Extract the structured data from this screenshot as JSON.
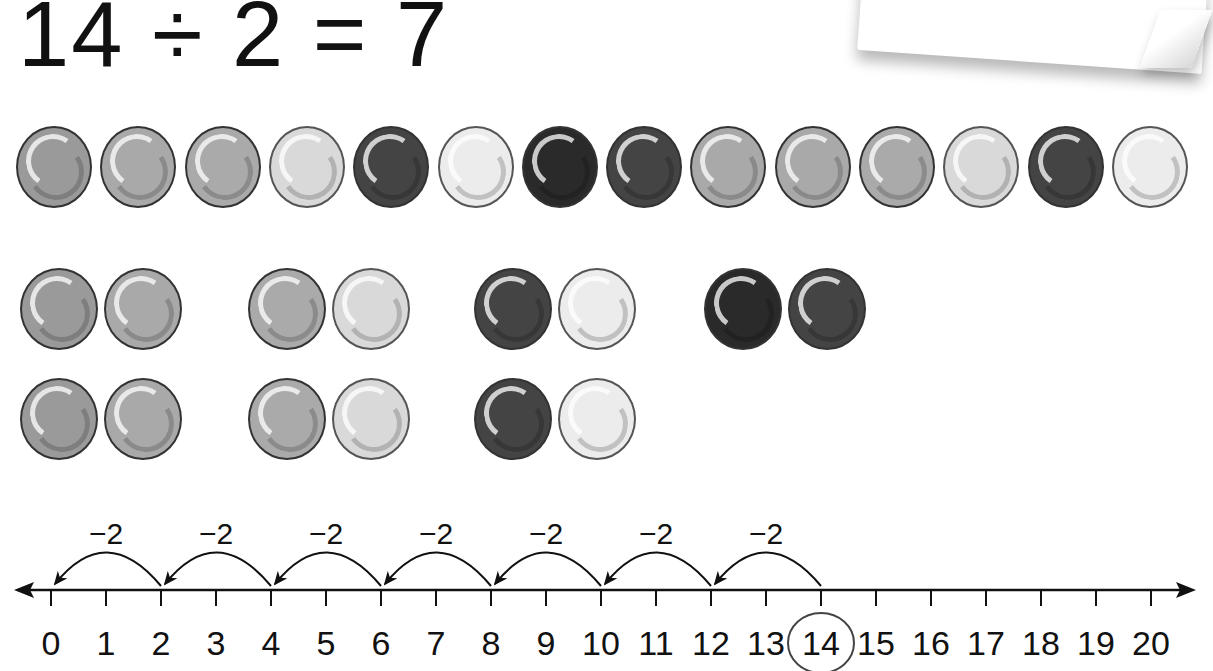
{
  "equation": {
    "dividend": "14",
    "operator": "÷",
    "divisor": "2",
    "equals": "=",
    "quotient": "7",
    "text": "14 ÷ 2 = 7"
  },
  "colors": {
    "mid_gray": "#9a9a9a",
    "light_mid_gray": "#a9a9a9",
    "speckled_gray": "#aaaaaa",
    "light_gray": "#d9d9d9",
    "dark_gray": "#444444",
    "very_light": "#ececec",
    "near_black": "#2a2a2a",
    "outline": "#333333"
  },
  "bead_row": [
    {
      "shade": "mid_gray"
    },
    {
      "shade": "light_mid_gray"
    },
    {
      "shade": "speckled_gray"
    },
    {
      "shade": "light_gray"
    },
    {
      "shade": "dark_gray"
    },
    {
      "shade": "very_light"
    },
    {
      "shade": "near_black"
    },
    {
      "shade": "dark_gray"
    },
    {
      "shade": "light_mid_gray"
    },
    {
      "shade": "light_mid_gray"
    },
    {
      "shade": "speckled_gray"
    },
    {
      "shade": "light_gray"
    },
    {
      "shade": "dark_gray"
    },
    {
      "shade": "very_light"
    }
  ],
  "bead_pairs": {
    "description": "14 beads arranged in 7 groups of 2",
    "row1": [
      [
        "mid_gray",
        "light_mid_gray"
      ],
      [
        "speckled_gray",
        "light_gray"
      ],
      [
        "dark_gray",
        "very_light"
      ],
      [
        "near_black",
        "dark_gray"
      ]
    ],
    "row2": [
      [
        "mid_gray",
        "light_mid_gray"
      ],
      [
        "speckled_gray",
        "light_gray"
      ],
      [
        "dark_gray",
        "very_light"
      ]
    ]
  },
  "number_line": {
    "min": 0,
    "max": 20,
    "ticks": [
      "0",
      "1",
      "2",
      "3",
      "4",
      "5",
      "6",
      "7",
      "8",
      "9",
      "10",
      "11",
      "12",
      "13",
      "14",
      "15",
      "16",
      "17",
      "18",
      "19",
      "20"
    ],
    "start_value": 14,
    "circled_value": "14",
    "jump_size": -2,
    "jumps": [
      {
        "from": 14,
        "to": 12,
        "label": "−2"
      },
      {
        "from": 12,
        "to": 10,
        "label": "−2"
      },
      {
        "from": 10,
        "to": 8,
        "label": "−2"
      },
      {
        "from": 8,
        "to": 6,
        "label": "−2"
      },
      {
        "from": 6,
        "to": 4,
        "label": "−2"
      },
      {
        "from": 4,
        "to": 2,
        "label": "−2"
      },
      {
        "from": 2,
        "to": 0,
        "label": "−2"
      }
    ],
    "jump_count": 7
  }
}
